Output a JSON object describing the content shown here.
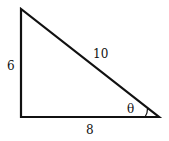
{
  "diagram": {
    "type": "right-triangle",
    "sides": {
      "vertical": "6",
      "hypotenuse": "10",
      "horizontal": "8"
    },
    "angle_label": "θ",
    "colors": {
      "stroke": "#111111",
      "background": "#ffffff"
    }
  }
}
